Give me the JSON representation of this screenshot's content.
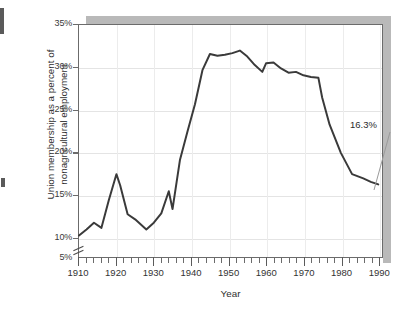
{
  "figure": {
    "y_axis_title_line1": "Union membership as a percent of",
    "y_axis_title_line2": "nonagricultural employment",
    "x_axis_title": "Year",
    "annotation_label": "16.3%",
    "line_color": "#3a3a3a",
    "grid_color": "#e4e4e4",
    "axis_color": "#6b6b6b",
    "shadow_color": "#b9b9b9",
    "background_color": "#ffffff"
  },
  "y_ticks": [
    {
      "label": "35%",
      "value": 35
    },
    {
      "label": "30%",
      "value": 30
    },
    {
      "label": "25%",
      "value": 25
    },
    {
      "label": "20%",
      "value": 20
    },
    {
      "label": "15%",
      "value": 15
    },
    {
      "label": "10%",
      "value": 10
    },
    {
      "label": "5%",
      "value": 5
    }
  ],
  "x_ticks": [
    {
      "label": "1910",
      "value": 1910
    },
    {
      "label": "1920",
      "value": 1920
    },
    {
      "label": "1930",
      "value": 1930
    },
    {
      "label": "1940",
      "value": 1940
    },
    {
      "label": "1950",
      "value": 1950
    },
    {
      "label": "1960",
      "value": 1960
    },
    {
      "label": "1970",
      "value": 1970
    },
    {
      "label": "1980",
      "value": 1980
    },
    {
      "label": "1990",
      "value": 1990
    }
  ],
  "chart_data": {
    "type": "line",
    "title": "",
    "xlabel": "Year",
    "ylabel": "Union membership as a percent of nonagricultural employment",
    "xlim": [
      1910,
      1991
    ],
    "ylim": [
      8.5,
      35
    ],
    "y_axis_broken_at": 5,
    "y_axis_break_note": "axis baseline labeled 5% with break symbol between 5% and 10%",
    "grid": true,
    "legend": null,
    "annotations": [
      {
        "text": "16.3%",
        "x": 1990,
        "y": 16.3,
        "leader_line": true
      }
    ],
    "x": [
      1910,
      1912,
      1914,
      1916,
      1918,
      1920,
      1921,
      1923,
      1925,
      1928,
      1930,
      1932,
      1934,
      1935,
      1937,
      1939,
      1941,
      1943,
      1945,
      1947,
      1949,
      1951,
      1953,
      1955,
      1957,
      1959,
      1960,
      1962,
      1964,
      1966,
      1968,
      1970,
      1972,
      1974,
      1975,
      1977,
      1980,
      1983,
      1986,
      1988,
      1990
    ],
    "y": [
      10.3,
      11.0,
      11.8,
      11.2,
      14.5,
      17.5,
      16.2,
      12.8,
      12.2,
      11.0,
      11.8,
      12.9,
      15.5,
      13.4,
      19.2,
      22.5,
      25.7,
      29.7,
      31.6,
      31.4,
      31.5,
      31.7,
      32.0,
      31.3,
      30.3,
      29.5,
      30.5,
      30.6,
      29.9,
      29.4,
      29.5,
      29.1,
      28.9,
      28.8,
      26.5,
      23.3,
      20.0,
      17.5,
      17.0,
      16.6,
      16.3
    ],
    "series_name": "Union membership share"
  }
}
